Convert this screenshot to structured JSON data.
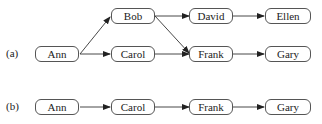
{
  "diagram": {
    "panels": [
      {
        "label": "(a)",
        "nodes": [
          {
            "id": "ann",
            "text": "Ann"
          },
          {
            "id": "bob",
            "text": "Bob"
          },
          {
            "id": "carol",
            "text": "Carol"
          },
          {
            "id": "david",
            "text": "David"
          },
          {
            "id": "ellen",
            "text": "Ellen"
          },
          {
            "id": "frank",
            "text": "Frank"
          },
          {
            "id": "gary",
            "text": "Gary"
          }
        ],
        "edges": [
          [
            "Ann",
            "Bob"
          ],
          [
            "Ann",
            "Carol"
          ],
          [
            "Bob",
            "David"
          ],
          [
            "Bob",
            "Frank"
          ],
          [
            "Carol",
            "Frank"
          ],
          [
            "David",
            "Ellen"
          ],
          [
            "Frank",
            "Gary"
          ]
        ]
      },
      {
        "label": "(b)",
        "nodes": [
          {
            "id": "ann",
            "text": "Ann"
          },
          {
            "id": "carol",
            "text": "Carol"
          },
          {
            "id": "frank",
            "text": "Frank"
          },
          {
            "id": "gary",
            "text": "Gary"
          }
        ],
        "edges": [
          [
            "Ann",
            "Carol"
          ],
          [
            "Carol",
            "Frank"
          ],
          [
            "Frank",
            "Gary"
          ]
        ]
      }
    ]
  }
}
